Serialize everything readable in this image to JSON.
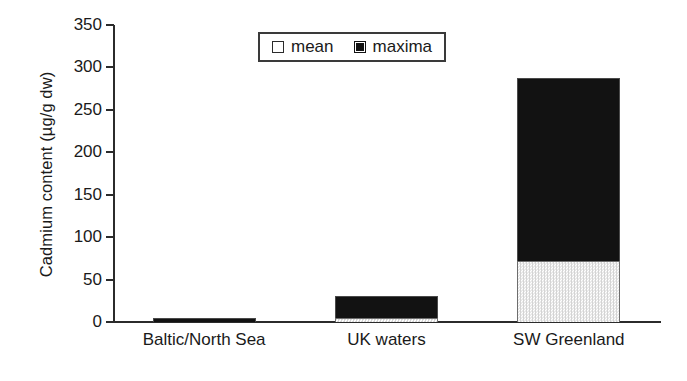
{
  "chart_data": {
    "type": "bar",
    "stacked": true,
    "title": "",
    "xlabel": "",
    "ylabel": "Cadmium content (µg/g dw)",
    "ylim": [
      0,
      350
    ],
    "ytick_step": 50,
    "yticks": [
      350,
      300,
      250,
      200,
      150,
      100,
      50,
      0
    ],
    "ytick_labels": [
      "350",
      "300",
      "250",
      "200",
      "150",
      "100",
      "50",
      "0"
    ],
    "grid": false,
    "categories": [
      "Baltic/North Sea",
      "UK waters",
      "SW Greenland"
    ],
    "series": [
      {
        "name": "mean",
        "values": [
          0,
          5,
          72
        ],
        "color": "#f0f0f0"
      },
      {
        "name": "maxima",
        "values": [
          5,
          31,
          288
        ],
        "color": "#121212"
      }
    ],
    "legend": {
      "position": "top-center",
      "entries": [
        {
          "label": "mean",
          "swatch": "white-square"
        },
        {
          "label": "maxima",
          "swatch": "black-square"
        }
      ]
    }
  }
}
